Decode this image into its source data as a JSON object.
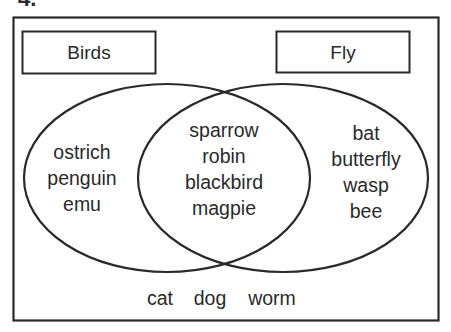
{
  "question": {
    "number": "4."
  },
  "venn": {
    "sets": [
      {
        "id": "birds",
        "label": "Birds"
      },
      {
        "id": "fly",
        "label": "Fly"
      }
    ],
    "regions": {
      "birds_only": [
        "ostrich",
        "penguin",
        "emu"
      ],
      "both": [
        "sparrow",
        "robin",
        "blackbird",
        "magpie"
      ],
      "fly_only": [
        "bat",
        "butterfly",
        "wasp",
        "bee"
      ],
      "neither": [
        "cat",
        "dog",
        "worm"
      ]
    }
  },
  "colors": {
    "stroke": "#2a2a2a",
    "background": "#ffffff",
    "text": "#2a2a2a"
  }
}
